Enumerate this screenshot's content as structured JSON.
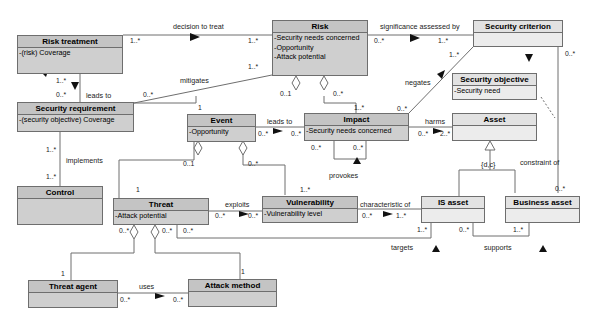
{
  "classes": {
    "risk_treatment": {
      "name": "Risk treatment",
      "attrs": [
        "-(risk) Coverage"
      ]
    },
    "risk": {
      "name": "Risk",
      "attrs": [
        "-Security needs concerned",
        "-Opportunity",
        "-Attack potential"
      ]
    },
    "security_criterion": {
      "name": "Security criterion",
      "attrs": []
    },
    "security_requirement": {
      "name": "Security requirement",
      "attrs": [
        "-(security objective) Coverage"
      ]
    },
    "security_objective": {
      "name": "Security objective",
      "attrs": [
        "-Security need"
      ]
    },
    "event": {
      "name": "Event",
      "attrs": [
        "-Opportunity"
      ]
    },
    "impact": {
      "name": "Impact",
      "attrs": [
        "-Security needs concerned"
      ]
    },
    "asset": {
      "name": "Asset",
      "attrs": []
    },
    "control": {
      "name": "Control",
      "attrs": []
    },
    "threat": {
      "name": "Threat",
      "attrs": [
        "-Attack potential"
      ]
    },
    "vulnerability": {
      "name": "Vulnerability",
      "attrs": [
        "-Vulnerability level"
      ]
    },
    "is_asset": {
      "name": "IS asset",
      "attrs": []
    },
    "business_asset": {
      "name": "Business asset",
      "attrs": []
    },
    "threat_agent": {
      "name": "Threat agent",
      "attrs": []
    },
    "attack_method": {
      "name": "Attack method",
      "attrs": []
    }
  },
  "associations": {
    "decision_to_treat": "decision to treat",
    "significance_assessed_by": "significance assessed by",
    "mitigates": "mitigates",
    "leads_to_req": "leads to",
    "negates": "negates",
    "implements": "implements",
    "leads_to_impact": "leads to",
    "harms": "harms",
    "provokes": "provokes",
    "constraint_of": "constraint of",
    "generalization_constraint": "{d,c}",
    "exploits": "exploits",
    "characteristic_of": "characteristic of",
    "targets": "targets",
    "supports": "supports",
    "uses": "uses"
  },
  "multiplicities": {
    "rt_decision": "1..*",
    "risk_decision": "1..*",
    "risk_signif": "0..*",
    "crit_signif": "1..*",
    "rt_leads": "1..*",
    "req_leads": "0..*",
    "req_mitigates": "0..*",
    "risk_mitigates": "1..*",
    "crit_negates": "1..*",
    "impact_negates": "0..*",
    "crit_constraint": "0..*",
    "bus_constraint": "0..*",
    "req_implements": "1..*",
    "ctrl_implements": "1..*",
    "event_risk": "1",
    "risk_event": "0..1",
    "risk_impact": "0..*",
    "impact_risk": "1..*",
    "event_leads": "0..*",
    "impact_leads": "0..*",
    "impact_harms": "0..*",
    "asset_harms": "2..*",
    "prov_a": "0..*",
    "prov_b": "0..*",
    "event_threat": "0..1",
    "threat_event": "1",
    "event_vuln": "0..*",
    "vuln_event": "1..*",
    "threat_exploits": "0..*",
    "vuln_exploits": "0..*",
    "vuln_char": "0..*",
    "is_char": "1..*",
    "threat_agent_agg": "0..*",
    "threat_method_agg": "0..*",
    "threat_targets": "0..*",
    "is_targets": "1..*",
    "is_supports": "0..*",
    "bus_supports": "1..*",
    "agent_1": "1",
    "method_1": "1",
    "agent_uses": "0..*",
    "method_uses": "0..*"
  },
  "colors": {
    "dark_fill": "#cfcfcf",
    "light_fill": "#ececec",
    "line": "#6e6e6e"
  }
}
